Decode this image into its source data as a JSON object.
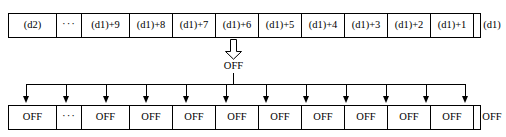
{
  "diagram": {
    "colors": {
      "line": "#000000",
      "background": "#ffffff",
      "text": "#000000"
    },
    "top_row": {
      "name": "delay-register-row",
      "cells": [
        {
          "label": "(d2)"
        },
        {
          "label": "···"
        },
        {
          "label": "(d1)+9"
        },
        {
          "label": "(d1)+8"
        },
        {
          "label": "(d1)+7"
        },
        {
          "label": "(d1)+6"
        },
        {
          "label": "(d1)+5"
        },
        {
          "label": "(d1)+4"
        },
        {
          "label": "(d1)+3"
        },
        {
          "label": "(d1)+2"
        },
        {
          "label": "(d1)+1"
        },
        {
          "label": "(d1)"
        }
      ],
      "widths": [
        48,
        25,
        48,
        43,
        43,
        43,
        43,
        43,
        43,
        43,
        43,
        36
      ]
    },
    "source": {
      "arrow_icon": "block-down-arrow-icon",
      "label": "OFF"
    },
    "bottom_row": {
      "name": "off-value-row",
      "cells": [
        {
          "label": "OFF"
        },
        {
          "label": "···"
        },
        {
          "label": "OFF"
        },
        {
          "label": "OFF"
        },
        {
          "label": "OFF"
        },
        {
          "label": "OFF"
        },
        {
          "label": "OFF"
        },
        {
          "label": "OFF"
        },
        {
          "label": "OFF"
        },
        {
          "label": "OFF"
        },
        {
          "label": "OFF"
        },
        {
          "label": "OFF"
        }
      ],
      "widths": [
        48,
        25,
        48,
        43,
        43,
        43,
        43,
        43,
        43,
        43,
        43,
        36
      ]
    },
    "bus": {
      "name": "distribution-bus",
      "arrow_count": 12,
      "arrow_x": [
        26,
        66,
        106,
        146,
        186,
        226,
        266,
        306,
        346,
        386,
        426,
        465
      ]
    }
  }
}
